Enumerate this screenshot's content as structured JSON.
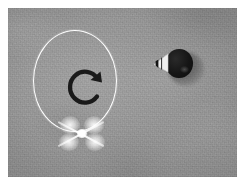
{
  "scene": {
    "title": "Overhead view of a quadcopter drone performing a clockwise yaw rotation",
    "surface_label": "concrete ground",
    "surface_color": "#9a9a9a",
    "frame": {
      "x": 8,
      "y": 8,
      "width": 229,
      "height": 169
    },
    "page_background": "#ffffff"
  },
  "annotations": {
    "rotation_circle": {
      "label": "rotation path circle",
      "color": "#ffffff",
      "stroke_width": 1.6,
      "center_x": 75,
      "center_y": 81,
      "radius_x": 42,
      "radius_y": 51
    },
    "rotation_arrow": {
      "label": "clockwise rotation arrow",
      "direction": "clockwise",
      "color": "#1a1a1a",
      "center_x": 78,
      "center_y": 79
    }
  },
  "objects": [
    {
      "name": "drone",
      "label": "white quadcopter drone",
      "color": "#ffffff",
      "rotor_count": 4,
      "center_x": 83,
      "center_y": 141
    },
    {
      "name": "dark-object",
      "label": "dark object with white cone marker and cast shadow",
      "body_color": "#111111",
      "marker_color": "#f2f2f2",
      "shadow_color": "#3a3a3a",
      "center_x": 180,
      "center_y": 72
    }
  ]
}
